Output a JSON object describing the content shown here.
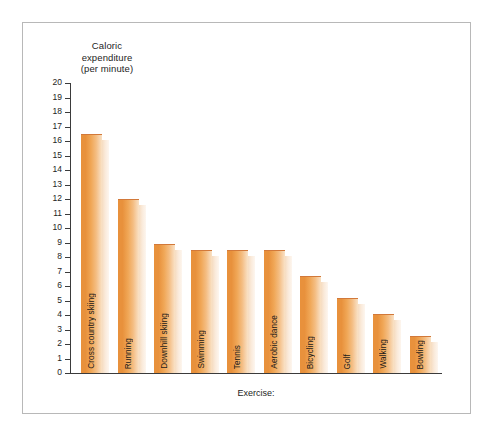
{
  "chart_data": {
    "type": "bar",
    "title": "",
    "ylabel": "Caloric expenditure (per minute)",
    "ylabel_lines": [
      "Caloric",
      "expenditure",
      "(per minute)"
    ],
    "xlabel": "Exercise:",
    "ylim": [
      0,
      20
    ],
    "ytick_step": 1,
    "grid": false,
    "legend": false,
    "bar_color": "#e8913c",
    "bar_highlight_color": "#f9e2c6",
    "bar_shadow_color": "#f6dcc0",
    "frame_color": "#b8b8b8",
    "axis_color": "#3b3b3b",
    "ytick_labels": [
      "20",
      "19",
      "18",
      "17",
      "16",
      "15",
      "14",
      "13",
      "12",
      "11",
      "10",
      "9",
      "8",
      "7",
      "6",
      "5",
      "4",
      "3",
      "2",
      "1",
      "0"
    ],
    "categories": [
      "Cross country skiing",
      "Running",
      "Downhill skiing",
      "Swimming",
      "Tennis",
      "Aerobic dance",
      "Bicycling",
      "Golf",
      "Walking",
      "Bowling"
    ],
    "values": [
      16.4,
      11.9,
      8.8,
      8.4,
      8.4,
      8.4,
      6.6,
      5.1,
      4.0,
      2.5
    ]
  }
}
